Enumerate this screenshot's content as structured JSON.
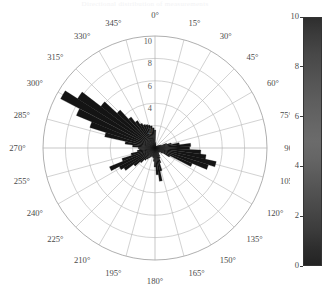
{
  "chart_title": "Directional distribution of measurements",
  "colorbar": {
    "name": "colorbar",
    "min": 0,
    "max": 10,
    "ticks": [
      10,
      8,
      6,
      4,
      2,
      0
    ],
    "orientation": "vertical",
    "colormap": "gray"
  },
  "chart_data": {
    "type": "bar",
    "subtype": "polar-rose",
    "title": "Directional distribution of measurements",
    "xlabel": "",
    "ylabel": "",
    "grid": true,
    "legend_position": "right",
    "theta_unit": "degrees",
    "theta_zero_location": "N",
    "theta_direction": "clockwise",
    "theta_tick_labels": [
      "0°",
      "15°",
      "30°",
      "45°",
      "60°",
      "75°",
      "90°",
      "105°",
      "120°",
      "135°",
      "150°",
      "165°",
      "180°",
      "195°",
      "210°",
      "225°",
      "240°",
      "255°",
      "270°",
      "285°",
      "300°",
      "315°",
      "330°",
      "345°"
    ],
    "theta_tick_values": [
      0,
      15,
      30,
      45,
      60,
      75,
      90,
      105,
      120,
      135,
      150,
      165,
      180,
      195,
      210,
      225,
      240,
      255,
      270,
      285,
      300,
      315,
      330,
      345
    ],
    "radial_tick_labels": [
      "2",
      "4",
      "6",
      "8",
      "10"
    ],
    "radial_tick_values": [
      2,
      4,
      6,
      8,
      10
    ],
    "rlim": [
      0,
      10
    ],
    "bin_width_deg": 5,
    "categories": [
      0,
      5,
      10,
      15,
      20,
      25,
      30,
      35,
      40,
      45,
      50,
      55,
      60,
      65,
      70,
      75,
      80,
      85,
      90,
      95,
      100,
      105,
      110,
      115,
      120,
      125,
      130,
      135,
      140,
      145,
      150,
      155,
      160,
      165,
      170,
      175,
      180,
      185,
      190,
      195,
      200,
      205,
      210,
      215,
      220,
      225,
      230,
      235,
      240,
      245,
      250,
      255,
      260,
      265,
      270,
      275,
      280,
      285,
      290,
      295,
      300,
      305,
      310,
      315,
      320,
      325,
      330,
      335,
      340,
      345,
      350,
      355
    ],
    "values": [
      1.6,
      0.5,
      0.4,
      0.3,
      0.2,
      0.2,
      0.2,
      0.2,
      0.2,
      0.2,
      0.3,
      0.4,
      0.5,
      0.6,
      1.1,
      1.5,
      2.2,
      3.2,
      3.1,
      4.1,
      4.6,
      5.6,
      5.0,
      3.6,
      1.5,
      0.8,
      0.6,
      0.5,
      0.5,
      0.6,
      0.8,
      1.0,
      1.4,
      2.1,
      3.0,
      2.4,
      1.7,
      1.2,
      0.9,
      0.8,
      0.8,
      0.9,
      1.0,
      1.2,
      1.4,
      1.8,
      2.4,
      3.3,
      3.6,
      4.4,
      3.1,
      2.2,
      1.6,
      1.4,
      1.5,
      2.0,
      2.7,
      4.6,
      6.1,
      7.6,
      9.5,
      8.2,
      6.1,
      4.6,
      3.5,
      2.9,
      2.5,
      2.3,
      2.2,
      2.1,
      2.0,
      1.8
    ]
  }
}
